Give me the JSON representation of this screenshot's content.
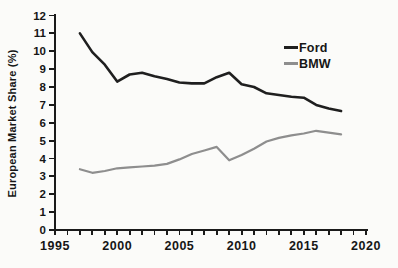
{
  "figure": {
    "background": "#fbfbf9",
    "text_color": "#161616",
    "axis_color": "#1a1a1a"
  },
  "chart_data": {
    "type": "line",
    "ylabel": "European Market Share (%)",
    "xlabel": "",
    "x": [
      1997,
      1998,
      1999,
      2000,
      2001,
      2002,
      2003,
      2004,
      2005,
      2006,
      2007,
      2008,
      2009,
      2010,
      2011,
      2012,
      2013,
      2014,
      2015,
      2016,
      2017,
      2018
    ],
    "series": [
      {
        "name": "Ford",
        "color": "#1f1f1f",
        "values": [
          11.0,
          9.95,
          9.25,
          8.3,
          8.7,
          8.8,
          8.6,
          8.45,
          8.25,
          8.2,
          8.2,
          8.55,
          8.8,
          8.15,
          8.0,
          7.65,
          7.55,
          7.45,
          7.4,
          7.0,
          6.8,
          6.65
        ]
      },
      {
        "name": "BMW",
        "color": "#8e8e8e",
        "values": [
          3.4,
          3.2,
          3.3,
          3.45,
          3.5,
          3.55,
          3.6,
          3.7,
          3.95,
          4.25,
          4.45,
          4.65,
          3.9,
          4.2,
          4.55,
          4.95,
          5.15,
          5.3,
          5.4,
          5.55,
          5.45,
          5.35
        ]
      }
    ],
    "xlim": [
      1995,
      2020
    ],
    "ylim": [
      0,
      12
    ],
    "x_major_ticks": [
      1995,
      2000,
      2005,
      2010,
      2015,
      2020
    ],
    "x_minor_tick_step": 1,
    "y_ticks": [
      0,
      1,
      2,
      3,
      4,
      5,
      6,
      7,
      8,
      9,
      10,
      11,
      12
    ],
    "grid": false,
    "legend_position": "upper right"
  }
}
